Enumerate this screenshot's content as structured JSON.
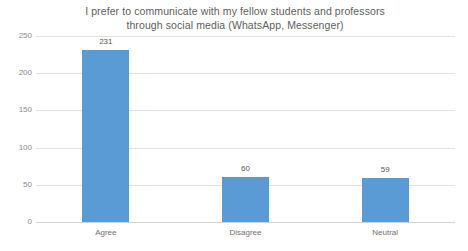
{
  "chart_data": {
    "type": "bar",
    "title": "I prefer to communicate with my fellow students and professors through social media (WhatsApp, Messenger)",
    "title_lines": [
      "I prefer to communicate with my fellow students and professors",
      "through social media (WhatsApp, Messenger)"
    ],
    "categories": [
      "Agree",
      "Disagree",
      "Neutral"
    ],
    "values": [
      231,
      60,
      59
    ],
    "xlabel": "",
    "ylabel": "",
    "ylim": [
      0,
      250
    ],
    "y_ticks": [
      0,
      50,
      100,
      150,
      200,
      250
    ],
    "y_tick_labels": [
      "0",
      "50",
      "100",
      "150",
      "200",
      "250"
    ],
    "data_labels": [
      "231",
      "60",
      "59"
    ],
    "grid": "horizontal",
    "legend": "none",
    "series": [
      {
        "name": "Responses",
        "values": [
          231,
          60,
          59
        ],
        "color": "#5B9BD5"
      }
    ]
  },
  "colors": {
    "bar": "#5B9BD5",
    "gridline": "#E2E2E2",
    "baseline": "#D3D3D3",
    "title_text": "#606060",
    "axis_text": "#8A8A8A",
    "label_text": "#595959",
    "background": "#FFFFFF"
  }
}
